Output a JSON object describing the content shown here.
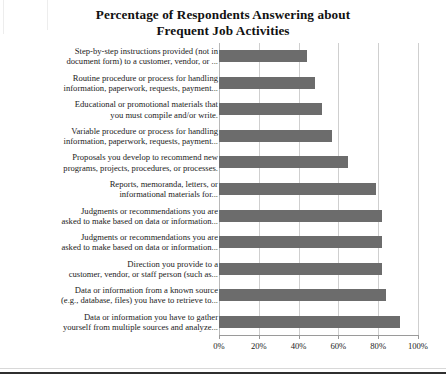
{
  "chart_data": {
    "type": "bar",
    "orientation": "horizontal",
    "title": "Percentage of Respondents Answering about Frequent Job Activities",
    "title_lines": [
      "Percentage of Respondents Answering about",
      "Frequent Job Activities"
    ],
    "xlabel": "",
    "ylabel": "",
    "xlim": [
      0,
      100
    ],
    "xticks": [
      0,
      20,
      40,
      60,
      80,
      100
    ],
    "xtick_labels": [
      "0%",
      "20%",
      "40%",
      "60%",
      "80%",
      "100%"
    ],
    "grid": "vertical",
    "legend": "none",
    "bar_color": "#6c6c6c",
    "categories": [
      "Step-by-step instructions provided (not in document form) to a customer, vendor, or ...",
      "Routine procedure or process for handling information, paperwork, requests, payment...",
      "Educational or promotional materials that you must compile and/or write.",
      "Variable procedure or process for handling information, paperwork, requests, payment...",
      "Proposals you develop to recommend new programs, projects, procedures, or processes.",
      "Reports, memoranda, letters, or informational materials for...",
      "Judgments or recommendations you are asked to make based on data or information...",
      "Judgments or recommendations you are asked to make based on data or information...",
      "Direction you provide to a customer, vendor, or staff person (such as...",
      "Data or information from a known source (e.g., database, files) you have to retrieve to...",
      "Data or information you have to gather yourself from multiple sources and analyze..."
    ],
    "category_lines": [
      [
        "Step-by-step instructions provided (not in",
        "document form) to a customer, vendor, or ..."
      ],
      [
        "Routine procedure or process for handling",
        "information, paperwork, requests, payment..."
      ],
      [
        "Educational or promotional materials that",
        "you must compile and/or write."
      ],
      [
        "Variable procedure or process for handling",
        "information, paperwork, requests, payment..."
      ],
      [
        "Proposals you develop to recommend new",
        "programs, projects, procedures, or processes."
      ],
      [
        "Reports, memoranda, letters, or",
        "informational materials for..."
      ],
      [
        "Judgments or recommendations you are",
        "asked to make based on data or information..."
      ],
      [
        "Judgments or recommendations you are",
        "asked to make based on data or information..."
      ],
      [
        "Direction you provide to a",
        "customer, vendor, or staff person (such as..."
      ],
      [
        "Data or information from a known source",
        "(e.g., database, files) you have to retrieve to..."
      ],
      [
        "Data or information you have to gather",
        "yourself from multiple sources and analyze..."
      ]
    ],
    "values": [
      44,
      48,
      52,
      57,
      65,
      79,
      82,
      82,
      82,
      84,
      91
    ]
  }
}
